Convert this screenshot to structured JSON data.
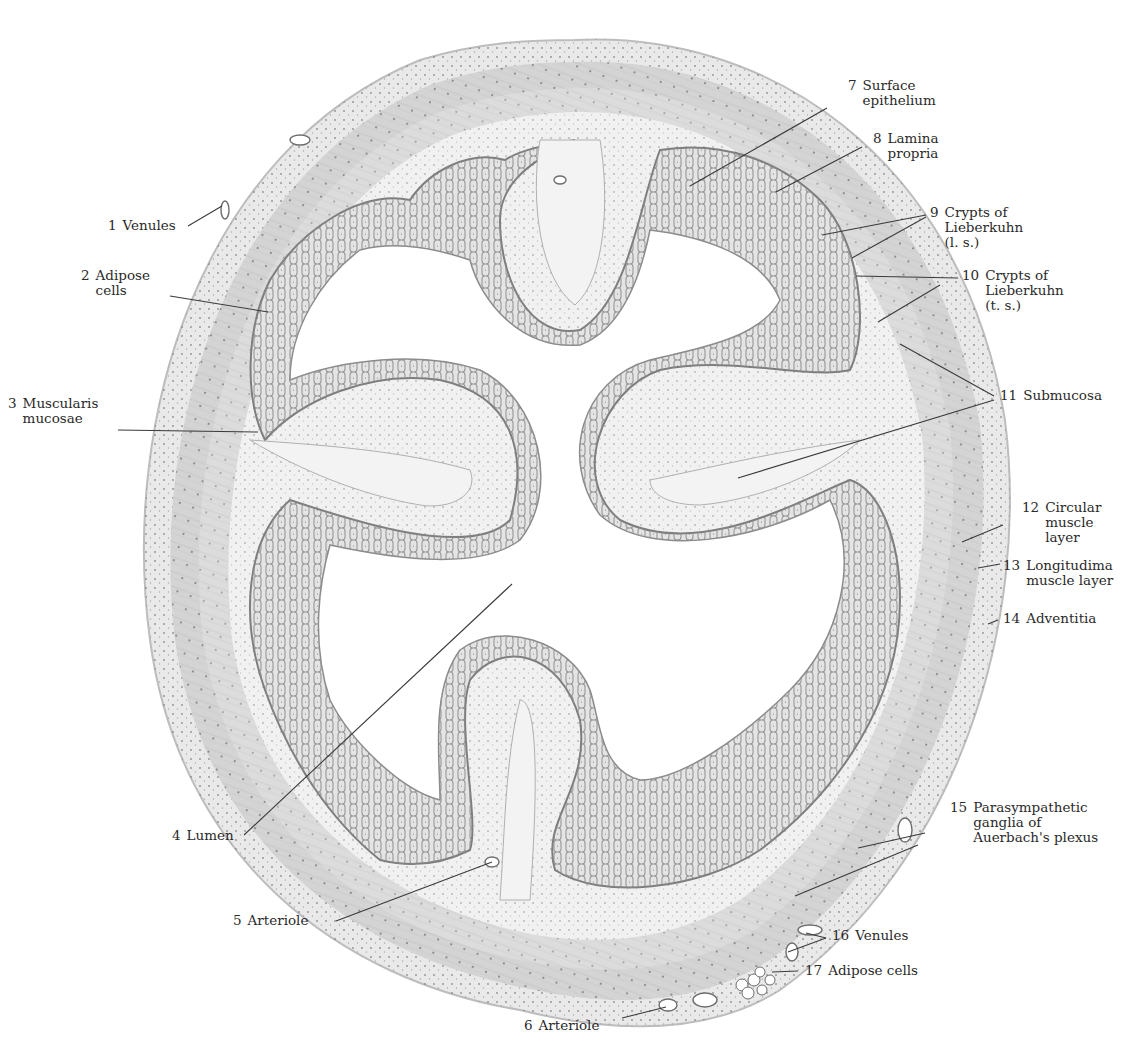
{
  "figure": {
    "colors": {
      "background": "#ffffff",
      "ink": "#2a2a2a",
      "adventitia": "#e6e6e6",
      "muscle_outer": "#d2d2d2",
      "muscle_inner": "#dcdcdc",
      "submucosa": "#ededed",
      "mucosa": "#e2e2e2",
      "crypt_outline": "#7a7a7a",
      "leader_line": "#3a3a3a"
    }
  },
  "labels": [
    {
      "num": "1",
      "lines": [
        "Venules"
      ],
      "x": 108,
      "y": 218,
      "leaders": [
        [
          188,
          226,
          222,
          206
        ]
      ]
    },
    {
      "num": "2",
      "lines": [
        "Adipose",
        "cells"
      ],
      "x": 81,
      "y": 268,
      "leaders": [
        [
          170,
          296,
          268,
          312
        ]
      ]
    },
    {
      "num": "3",
      "lines": [
        "Muscularis",
        "mucosae"
      ],
      "x": 8,
      "y": 396,
      "leaders": [
        [
          118,
          430,
          258,
          432
        ]
      ]
    },
    {
      "num": "4",
      "lines": [
        "Lumen"
      ],
      "x": 172,
      "y": 828,
      "leaders": [
        [
          244,
          835,
          512,
          584
        ]
      ]
    },
    {
      "num": "5",
      "lines": [
        "Arteriole"
      ],
      "x": 233,
      "y": 913,
      "leaders": [
        [
          336,
          921,
          492,
          862
        ]
      ]
    },
    {
      "num": "6",
      "lines": [
        "Arteriole"
      ],
      "x": 524,
      "y": 1018,
      "leaders": [
        [
          622,
          1018,
          666,
          1007
        ]
      ]
    },
    {
      "num": "7",
      "lines": [
        "Surface",
        "epithelium"
      ],
      "x": 848,
      "y": 78,
      "leaders": [
        [
          827,
          108,
          690,
          186
        ]
      ]
    },
    {
      "num": "8",
      "lines": [
        "Lamina",
        "propria"
      ],
      "x": 873,
      "y": 131,
      "leaders": [
        [
          862,
          147,
          776,
          192
        ]
      ]
    },
    {
      "num": "9",
      "lines": [
        "Crypts of",
        "Lieberkuhn",
        "(l. s.)"
      ],
      "x": 930,
      "y": 205,
      "leaders": [
        [
          926,
          215,
          822,
          235
        ],
        [
          926,
          217,
          852,
          258
        ]
      ]
    },
    {
      "num": "10",
      "lines": [
        "Crypts of",
        "Lieberkuhn",
        "(t. s.)"
      ],
      "x": 962,
      "y": 268,
      "leaders": [
        [
          958,
          278,
          856,
          276
        ],
        [
          940,
          285,
          878,
          322
        ]
      ]
    },
    {
      "num": "11",
      "lines": [
        "Submucosa"
      ],
      "x": 1000,
      "y": 388,
      "leaders": [
        [
          994,
          396,
          900,
          344
        ],
        [
          994,
          400,
          738,
          478
        ]
      ]
    },
    {
      "num": "12",
      "lines": [
        "Circular",
        "muscle",
        "layer"
      ],
      "x": 1022,
      "y": 500,
      "leaders": [
        [
          1003,
          525,
          962,
          542
        ]
      ]
    },
    {
      "num": "13",
      "lines": [
        "Longitudima",
        "muscle layer"
      ],
      "x": 1003,
      "y": 558,
      "leaders": [
        [
          1000,
          564,
          978,
          568
        ]
      ]
    },
    {
      "num": "14",
      "lines": [
        "Adventitia"
      ],
      "x": 1003,
      "y": 611,
      "leaders": [
        [
          998,
          620,
          988,
          624
        ]
      ]
    },
    {
      "num": "15",
      "lines": [
        "Parasympathetic",
        "ganglia of",
        "Auerbach's plexus"
      ],
      "x": 950,
      "y": 800,
      "leaders": [
        [
          925,
          833,
          858,
          848
        ],
        [
          918,
          845,
          795,
          896
        ]
      ]
    },
    {
      "num": "16",
      "lines": [
        "Venules"
      ],
      "x": 832,
      "y": 928,
      "leaders": [
        [
          826,
          938,
          806,
          933
        ],
        [
          826,
          938,
          788,
          952
        ]
      ]
    },
    {
      "num": "17",
      "lines": [
        "Adipose cells"
      ],
      "x": 805,
      "y": 963,
      "leaders": [
        [
          798,
          971,
          772,
          972
        ]
      ]
    }
  ]
}
